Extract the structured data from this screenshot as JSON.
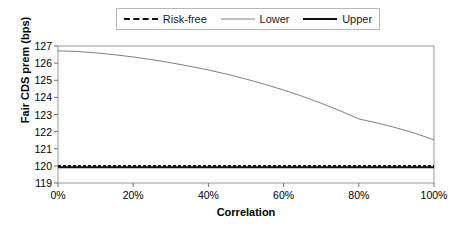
{
  "chart_data": {
    "type": "line",
    "title": "",
    "xlabel": "Correlation",
    "ylabel": "Fair CDS prem (bps)",
    "xlim": [
      0,
      100
    ],
    "ylim": [
      119,
      127
    ],
    "grid": false,
    "legend_position": "top-center",
    "x_ticks": [
      "0%",
      "20%",
      "40%",
      "60%",
      "80%",
      "100%"
    ],
    "x_tick_values": [
      0,
      20,
      40,
      60,
      80,
      100
    ],
    "y_ticks": [
      "119",
      "120",
      "121",
      "122",
      "123",
      "124",
      "125",
      "126",
      "127"
    ],
    "y_tick_values": [
      119,
      120,
      121,
      122,
      123,
      124,
      125,
      126,
      127
    ],
    "x": [
      0,
      5,
      10,
      15,
      20,
      25,
      30,
      35,
      40,
      45,
      50,
      55,
      60,
      65,
      70,
      75,
      80,
      85,
      90,
      95,
      100
    ],
    "series": [
      {
        "name": "Risk-free",
        "style": "dashed",
        "color": "#111111",
        "width": 2,
        "values": [
          120.0,
          120.0,
          120.0,
          120.0,
          120.0,
          120.0,
          120.0,
          120.0,
          120.0,
          120.0,
          120.0,
          120.0,
          120.0,
          120.0,
          120.0,
          120.0,
          120.0,
          120.0,
          120.0,
          120.0,
          120.0
        ]
      },
      {
        "name": "Lower",
        "style": "solid",
        "color": "#808080",
        "width": 1,
        "values": [
          126.72,
          126.68,
          126.6,
          126.49,
          126.36,
          126.2,
          126.02,
          125.82,
          125.6,
          125.35,
          125.07,
          124.76,
          124.43,
          124.06,
          123.66,
          123.22,
          122.74,
          122.5,
          122.22,
          121.9,
          121.52
        ]
      },
      {
        "name": "Upper",
        "style": "solid",
        "color": "#111111",
        "width": 2,
        "values": [
          119.92,
          119.92,
          119.92,
          119.92,
          119.92,
          119.92,
          119.92,
          119.92,
          119.92,
          119.92,
          119.92,
          119.92,
          119.92,
          119.92,
          119.92,
          119.92,
          119.92,
          119.92,
          119.92,
          119.92,
          119.92
        ]
      }
    ]
  },
  "legend": {
    "items": [
      {
        "label": "Risk-free"
      },
      {
        "label": "Lower"
      },
      {
        "label": "Upper"
      }
    ]
  },
  "axes": {
    "y_title": "Fair CDS prem (bps)",
    "x_title": "Correlation"
  }
}
